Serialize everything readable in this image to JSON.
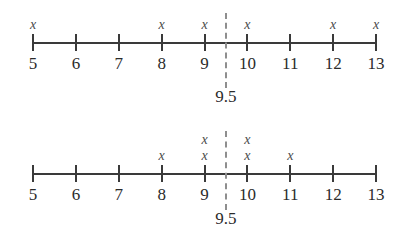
{
  "figure": {
    "background_color": "#ffffff",
    "ink_color": "#2b2b2b",
    "axis_color": "#3a3a3a",
    "divider_color": "#8e8e8e",
    "mark_glyph": "x"
  },
  "chart_data": [
    {
      "type": "scatter",
      "name": "top-dot-plot",
      "title": "",
      "xlabel": "",
      "ylabel": "",
      "xlim": [
        5,
        13
      ],
      "grid": false,
      "legend": "none",
      "tick_labels": [
        "5",
        "6",
        "7",
        "8",
        "9",
        "10",
        "11",
        "12",
        "13"
      ],
      "ticks": [
        5,
        6,
        7,
        8,
        9,
        10,
        11,
        12,
        13
      ],
      "categories": [
        5,
        6,
        7,
        8,
        9,
        10,
        11,
        12,
        13
      ],
      "values": [
        1,
        0,
        0,
        1,
        1,
        1,
        0,
        1,
        1
      ],
      "observations": [
        5,
        8,
        9,
        10,
        12,
        13
      ],
      "marks": [
        {
          "value": 5,
          "stack": 1
        },
        {
          "value": 8,
          "stack": 1
        },
        {
          "value": 9,
          "stack": 1
        },
        {
          "value": 10,
          "stack": 1
        },
        {
          "value": 12,
          "stack": 1
        },
        {
          "value": 13,
          "stack": 1
        }
      ],
      "annotation": {
        "x": 9.5,
        "label": "9.5",
        "style": "dashed-vertical-line"
      }
    },
    {
      "type": "scatter",
      "name": "bottom-dot-plot",
      "title": "",
      "xlabel": "",
      "ylabel": "",
      "xlim": [
        5,
        13
      ],
      "grid": false,
      "legend": "none",
      "tick_labels": [
        "5",
        "6",
        "7",
        "8",
        "9",
        "10",
        "11",
        "12",
        "13"
      ],
      "ticks": [
        5,
        6,
        7,
        8,
        9,
        10,
        11,
        12,
        13
      ],
      "categories": [
        5,
        6,
        7,
        8,
        9,
        10,
        11,
        12,
        13
      ],
      "values": [
        0,
        0,
        0,
        1,
        2,
        2,
        1,
        0,
        0
      ],
      "observations": [
        8,
        9,
        9,
        10,
        10,
        11
      ],
      "marks": [
        {
          "value": 8,
          "stack": 1
        },
        {
          "value": 9,
          "stack": 2
        },
        {
          "value": 10,
          "stack": 2
        },
        {
          "value": 11,
          "stack": 1
        }
      ],
      "annotation": {
        "x": 9.5,
        "label": "9.5",
        "style": "dashed-vertical-line"
      }
    }
  ],
  "plots": {
    "top": {
      "tick_labels": [
        "5",
        "6",
        "7",
        "8",
        "9",
        "10",
        "11",
        "12",
        "13"
      ],
      "marks": [
        {
          "label": "x",
          "value": 5,
          "level": 1
        },
        {
          "label": "x",
          "value": 8,
          "level": 1
        },
        {
          "label": "x",
          "value": 9,
          "level": 1
        },
        {
          "label": "x",
          "value": 10,
          "level": 1
        },
        {
          "label": "x",
          "value": 12,
          "level": 1
        },
        {
          "label": "x",
          "value": 13,
          "level": 1
        }
      ],
      "divider_label": "9.5"
    },
    "bottom": {
      "tick_labels": [
        "5",
        "6",
        "7",
        "8",
        "9",
        "10",
        "11",
        "12",
        "13"
      ],
      "marks": [
        {
          "label": "x",
          "value": 8,
          "level": 1
        },
        {
          "label": "x",
          "value": 9,
          "level": 1
        },
        {
          "label": "x",
          "value": 9,
          "level": 2
        },
        {
          "label": "x",
          "value": 10,
          "level": 1
        },
        {
          "label": "x",
          "value": 10,
          "level": 2
        },
        {
          "label": "x",
          "value": 11,
          "level": 1
        }
      ],
      "divider_label": "9.5"
    }
  }
}
